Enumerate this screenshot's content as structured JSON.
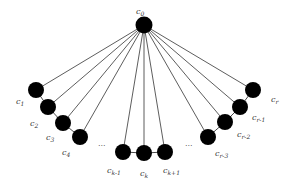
{
  "diagram": {
    "title": "",
    "hub": {
      "id": "c0",
      "label": "c",
      "sub": "0",
      "x": 144,
      "y": 25,
      "lx": 136,
      "ly": 14
    },
    "node_radius": 8,
    "hub_radius": 8.5,
    "node_color": "#000000",
    "edge_color": "#333333",
    "nodes": [
      {
        "id": "c1",
        "label": "c",
        "sub": "1",
        "x": 36,
        "y": 90,
        "lx": 16,
        "ly": 104
      },
      {
        "id": "c2",
        "label": "c",
        "sub": "2",
        "x": 48,
        "y": 107,
        "lx": 30,
        "ly": 126
      },
      {
        "id": "c3",
        "label": "c",
        "sub": "3",
        "x": 63,
        "y": 123,
        "lx": 46,
        "ly": 140
      },
      {
        "id": "c4",
        "label": "c",
        "sub": "4",
        "x": 80,
        "y": 137,
        "lx": 62,
        "ly": 155
      },
      {
        "id": "ck-1",
        "label": "c",
        "sub": "k-1",
        "x": 123,
        "y": 152,
        "lx": 107,
        "ly": 173
      },
      {
        "id": "ck",
        "label": "c",
        "sub": "k",
        "x": 144,
        "y": 153,
        "lx": 140,
        "ly": 176
      },
      {
        "id": "ck+1",
        "label": "c",
        "sub": "k+1",
        "x": 165,
        "y": 152,
        "lx": 163,
        "ly": 173
      },
      {
        "id": "cr-3",
        "label": "c",
        "sub": "r-3",
        "x": 208,
        "y": 137,
        "lx": 215,
        "ly": 156
      },
      {
        "id": "cr-2",
        "label": "c",
        "sub": "r-2",
        "x": 225,
        "y": 122,
        "lx": 237,
        "ly": 137
      },
      {
        "id": "cr-1",
        "label": "c",
        "sub": "r-1",
        "x": 240,
        "y": 107,
        "lx": 252,
        "ly": 120
      },
      {
        "id": "cr",
        "label": "c",
        "sub": "r",
        "x": 253,
        "y": 90,
        "lx": 271,
        "ly": 102
      }
    ],
    "path_edges": [
      [
        "c1",
        "c2"
      ],
      [
        "c2",
        "c3"
      ],
      [
        "c3",
        "c4"
      ],
      [
        "ck-1",
        "ck"
      ],
      [
        "ck",
        "ck+1"
      ],
      [
        "cr-3",
        "cr-2"
      ],
      [
        "cr-2",
        "cr-1"
      ],
      [
        "cr-1",
        "cr"
      ]
    ],
    "ellipses": [
      {
        "text": "...",
        "x": 98,
        "y": 146
      },
      {
        "text": "...",
        "x": 185,
        "y": 146
      }
    ]
  }
}
